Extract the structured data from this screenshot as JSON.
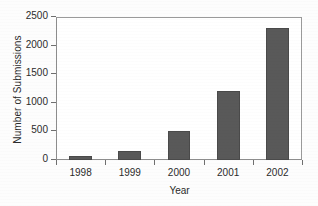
{
  "chart_data": {
    "type": "bar",
    "title": "",
    "xlabel": "Year",
    "ylabel": "Number of Submissions",
    "categories": [
      "1998",
      "1999",
      "2000",
      "2001",
      "2002"
    ],
    "values": [
      70,
      160,
      510,
      1200,
      2300
    ],
    "ylim": [
      0,
      2500
    ],
    "yticks": [
      0,
      500,
      1000,
      1500,
      2000,
      2500
    ],
    "ytick_labels": [
      "0",
      "500",
      "1000",
      "1500",
      "2000",
      "2500"
    ],
    "grid": false,
    "legend": null,
    "bar_color": "#595959",
    "bar_edge_color": "#4a4a4a",
    "axis_color": "#8d8d8d",
    "background_color": "#ffffff",
    "text_color": "#2b2b2b"
  }
}
